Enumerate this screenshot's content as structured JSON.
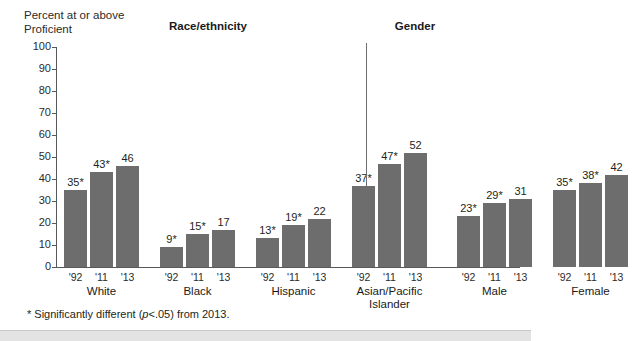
{
  "axis_title": "Percent at or above Proficient",
  "group_headers": {
    "race": "Race/ethnicity",
    "gender": "Gender"
  },
  "footnote": {
    "prefix": "* Significantly different (",
    "italic": "p",
    "suffix": "<.05) from 2013."
  },
  "colors": {
    "bar": "#6d6d6d",
    "axis": "#58595b",
    "text": "#231f20",
    "divider": "#6d6e71",
    "band": "#e3e3e3"
  },
  "chart_data": {
    "type": "bar",
    "title": "Percent at or above Proficient",
    "xlabel": "",
    "ylabel": "Percent at or above Proficient",
    "ylim": [
      0,
      100
    ],
    "ytick_labels": [
      "100",
      "90",
      "80",
      "70",
      "60",
      "50",
      "40",
      "30",
      "20",
      "10",
      "0"
    ],
    "ytick_values": [
      100,
      90,
      80,
      70,
      60,
      50,
      40,
      30,
      20,
      10,
      0
    ],
    "grid": false,
    "legend": "none",
    "categories": [
      "'92",
      "'11",
      "'13"
    ],
    "sections": [
      {
        "header": "Race/ethnicity",
        "groups": [
          {
            "label": "White",
            "label_lines": [
              "White"
            ],
            "bars": [
              {
                "x": "'92",
                "value": 35,
                "label": "35*",
                "significant": true
              },
              {
                "x": "'11",
                "value": 43,
                "label": "43*",
                "significant": true
              },
              {
                "x": "'13",
                "value": 46,
                "label": "46",
                "significant": false
              }
            ]
          },
          {
            "label": "Black",
            "label_lines": [
              "Black"
            ],
            "bars": [
              {
                "x": "'92",
                "value": 9,
                "label": "9*",
                "significant": true
              },
              {
                "x": "'11",
                "value": 15,
                "label": "15*",
                "significant": true
              },
              {
                "x": "'13",
                "value": 17,
                "label": "17",
                "significant": false
              }
            ]
          },
          {
            "label": "Hispanic",
            "label_lines": [
              "Hispanic"
            ],
            "bars": [
              {
                "x": "'92",
                "value": 13,
                "label": "13*",
                "significant": true
              },
              {
                "x": "'11",
                "value": 19,
                "label": "19*",
                "significant": true
              },
              {
                "x": "'13",
                "value": 22,
                "label": "22",
                "significant": false
              }
            ]
          },
          {
            "label": "Asian/Pacific Islander",
            "label_lines": [
              "Asian/Pacific",
              "Islander"
            ],
            "bars": [
              {
                "x": "'92",
                "value": 37,
                "label": "37*",
                "significant": true
              },
              {
                "x": "'11",
                "value": 47,
                "label": "47*",
                "significant": true
              },
              {
                "x": "'13",
                "value": 52,
                "label": "52",
                "significant": false
              }
            ]
          }
        ]
      },
      {
        "header": "Gender",
        "groups": [
          {
            "label": "Male",
            "label_lines": [
              "Male"
            ],
            "bars": [
              {
                "x": "'92",
                "value": 23,
                "label": "23*",
                "significant": true
              },
              {
                "x": "'11",
                "value": 29,
                "label": "29*",
                "significant": true
              },
              {
                "x": "'13",
                "value": 31,
                "label": "31",
                "significant": false
              }
            ]
          },
          {
            "label": "Female",
            "label_lines": [
              "Female"
            ],
            "bars": [
              {
                "x": "'92",
                "value": 35,
                "label": "35*",
                "significant": true
              },
              {
                "x": "'11",
                "value": 38,
                "label": "38*",
                "significant": true
              },
              {
                "x": "'13",
                "value": 42,
                "label": "42",
                "significant": false
              }
            ]
          }
        ]
      }
    ],
    "annotation": "* Significantly different (p<.05) from 2013."
  }
}
